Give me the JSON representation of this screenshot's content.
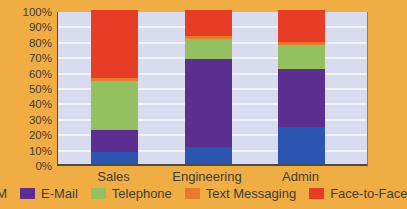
{
  "chart_data": {
    "type": "bar",
    "subtype": "stacked-100-percent-column",
    "title": "",
    "xlabel": "",
    "ylabel": "",
    "categories": [
      "Sales",
      "Engineering",
      "Admin"
    ],
    "series": [
      {
        "name": "IM",
        "color": "#2a55b0",
        "values": [
          8,
          11,
          24
        ]
      },
      {
        "name": "E-Mail",
        "color": "#5c2e90",
        "values": [
          14,
          57,
          38
        ]
      },
      {
        "name": "Telephone",
        "color": "#95c05f",
        "values": [
          32,
          13,
          15
        ]
      },
      {
        "name": "Text Messaging",
        "color": "#e97a2d",
        "values": [
          2,
          2,
          2
        ]
      },
      {
        "name": "Face-to-Face",
        "color": "#e73c25",
        "values": [
          44,
          17,
          21
        ]
      }
    ],
    "y_ticks": [
      "100%",
      "90%",
      "80%",
      "70%",
      "60%",
      "50%",
      "40%",
      "30%",
      "20%",
      "10%",
      "0%"
    ],
    "ylim": [
      0,
      100
    ],
    "grid": "horizontal",
    "legend_position": "bottom"
  },
  "style": {
    "background_color": "#f0ad44",
    "plot_background_color": "#d9dcee",
    "gridline_color": "#f1f2f8",
    "axis_line_color": "#4c4b40",
    "text_color": "#3e3e37"
  }
}
